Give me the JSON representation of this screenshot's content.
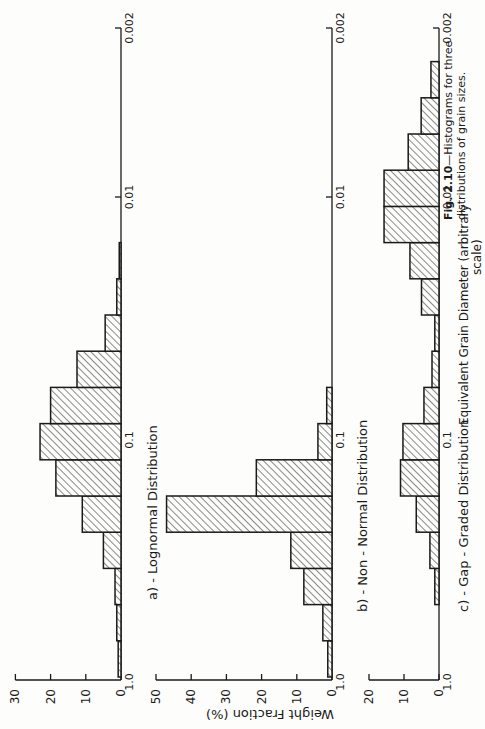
{
  "caption": {
    "label": "Fig. 2.10",
    "text": "—Histograms for three",
    "line2": "distributions of grain sizes."
  },
  "orientation": "rotated-90-ccw",
  "colors": {
    "background": "#fdfdfb",
    "ink": "#1a1a1a"
  },
  "chart_data": [
    {
      "type": "bar",
      "panel": "a",
      "title": "a) - Lognormal Distribution",
      "xlabel": "Equivalent Grain Diameter (arbitrary scale)",
      "ylabel": "Weight Fraction (%)",
      "x_scale": "log",
      "x_ticks": [
        "1.0",
        "0.1",
        "0.01",
        "0.002"
      ],
      "y_ticks": [
        "0",
        "10",
        "20",
        "30"
      ],
      "ylim": [
        0,
        30
      ],
      "bin_count": 12,
      "values": [
        0.8,
        1.2,
        1.7,
        5,
        11,
        18.5,
        23,
        20,
        12.5,
        4.5,
        1.2,
        0.5
      ]
    },
    {
      "type": "bar",
      "panel": "b",
      "title": "b) - Non - Normal Distribution",
      "xlabel": "Equivalent Grain Diameter (arbitrary scale)",
      "ylabel": "Weight Fraction (%)",
      "x_scale": "log",
      "x_ticks": [
        "1.0",
        "0.1",
        "0.01",
        "0.002"
      ],
      "y_ticks": [
        "0",
        "10",
        "20",
        "30",
        "40",
        "50"
      ],
      "ylim": [
        0,
        50
      ],
      "bin_count": 8,
      "values": [
        1.2,
        2.6,
        8,
        11.7,
        47,
        21.5,
        4,
        1.5
      ]
    },
    {
      "type": "bar",
      "panel": "c",
      "title": "c) - Gap - Graded Distribution",
      "xlabel": "Equivalent Grain Diameter (arbitrary scale)",
      "ylabel": "Weight Fraction (%)",
      "x_scale": "log",
      "x_ticks": [
        "1.0",
        "0.1",
        "0.01",
        "0.002"
      ],
      "y_ticks": [
        "0",
        "10",
        "20"
      ],
      "ylim": [
        0,
        20
      ],
      "bin_count": 17,
      "values": [
        0,
        0,
        1.2,
        2.6,
        6.5,
        11,
        10.3,
        4.3,
        2,
        1.2,
        5,
        8.3,
        15.7,
        15.7,
        8.8,
        5.1,
        2.3
      ]
    }
  ],
  "labels": {
    "ylabel": "Weight   Fraction   (%)",
    "xlabel_line1": "Equivalent   Grain   Diameter   (arbitrary",
    "xlabel_line2": "scale)"
  }
}
